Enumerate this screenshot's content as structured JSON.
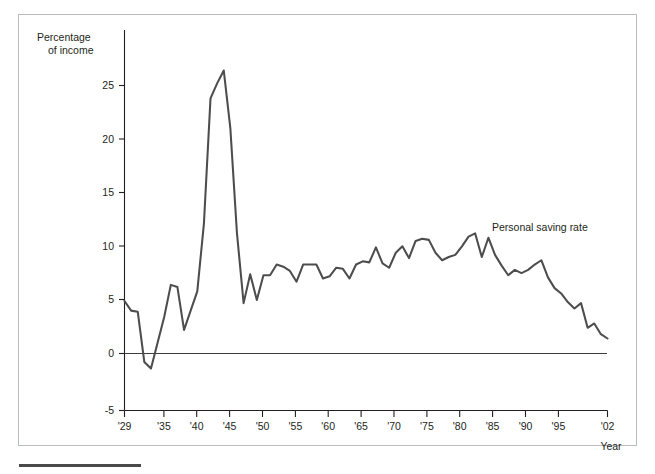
{
  "figure": {
    "background_color": "#ffffff",
    "frame_color": "#b9bcbe",
    "line_color": "#4d4d4d",
    "text_color": "#231f20"
  },
  "axis": {
    "y_title_line1": "Percentage",
    "y_title_line2": "of income",
    "x_title": "Year",
    "y_ticks": [
      "-5",
      "0",
      "5",
      "10",
      "15",
      "20",
      "25"
    ],
    "x_ticks": [
      "'29",
      "'35",
      "'40",
      "'45",
      "'50",
      "'55",
      "'60",
      "'65",
      "'70",
      "'75",
      "'80",
      "'85",
      "'90",
      "'95",
      "'02"
    ]
  },
  "annotations": {
    "series_label": "Personal saving rate"
  },
  "chart_data": {
    "type": "line",
    "title": "",
    "subtitle": "",
    "xlabel": "Year",
    "ylabel": "Percentage of income",
    "xlim": [
      1929,
      2002
    ],
    "ylim": [
      -5,
      27.5
    ],
    "grid": false,
    "legend_position": "inline-right",
    "y_ticks": [
      -5,
      0,
      5,
      10,
      15,
      20,
      25
    ],
    "x_tick_values": [
      1929,
      1935,
      1940,
      1945,
      1950,
      1955,
      1960,
      1965,
      1970,
      1975,
      1980,
      1985,
      1990,
      1995,
      2002
    ],
    "x_tick_labels": [
      "'29",
      "'35",
      "'40",
      "'45",
      "'50",
      "'55",
      "'60",
      "'65",
      "'70",
      "'75",
      "'80",
      "'85",
      "'90",
      "'95",
      "'02"
    ],
    "series": [
      {
        "name": "Personal saving rate",
        "color": "#4d4d4d",
        "x": [
          1929,
          1930,
          1931,
          1932,
          1933,
          1934,
          1935,
          1936,
          1937,
          1938,
          1939,
          1940,
          1941,
          1942,
          1943,
          1944,
          1945,
          1946,
          1947,
          1948,
          1949,
          1950,
          1951,
          1952,
          1953,
          1954,
          1955,
          1956,
          1957,
          1958,
          1959,
          1960,
          1961,
          1962,
          1963,
          1964,
          1965,
          1966,
          1967,
          1968,
          1969,
          1970,
          1971,
          1972,
          1973,
          1974,
          1975,
          1976,
          1977,
          1978,
          1979,
          1980,
          1981,
          1982,
          1983,
          1984,
          1985,
          1986,
          1987,
          1988,
          1989,
          1990,
          1991,
          1992,
          1993,
          1994,
          1995,
          1996,
          1997,
          1998,
          1999,
          2000,
          2001,
          2002
        ],
        "values": [
          4.9,
          4.0,
          3.9,
          -0.8,
          -1.4,
          1.0,
          3.4,
          6.4,
          6.2,
          2.2,
          4.0,
          5.8,
          12.1,
          23.8,
          25.2,
          26.4,
          21.0,
          11.2,
          4.7,
          7.4,
          5.0,
          7.3,
          7.3,
          8.3,
          8.1,
          7.7,
          6.7,
          8.3,
          8.3,
          8.3,
          7.0,
          7.2,
          8.0,
          7.9,
          7.0,
          8.3,
          8.6,
          8.5,
          9.9,
          8.4,
          8.0,
          9.4,
          10.0,
          8.9,
          10.5,
          10.7,
          10.6,
          9.4,
          8.7,
          9.0,
          9.2,
          10.0,
          10.9,
          11.2,
          9.0,
          10.8,
          9.2,
          8.2,
          7.3,
          7.8,
          7.5,
          7.8,
          8.3,
          8.7,
          7.1,
          6.1,
          5.6,
          4.8,
          4.2,
          4.7,
          2.4,
          2.8,
          1.8,
          1.4
        ]
      }
    ]
  }
}
